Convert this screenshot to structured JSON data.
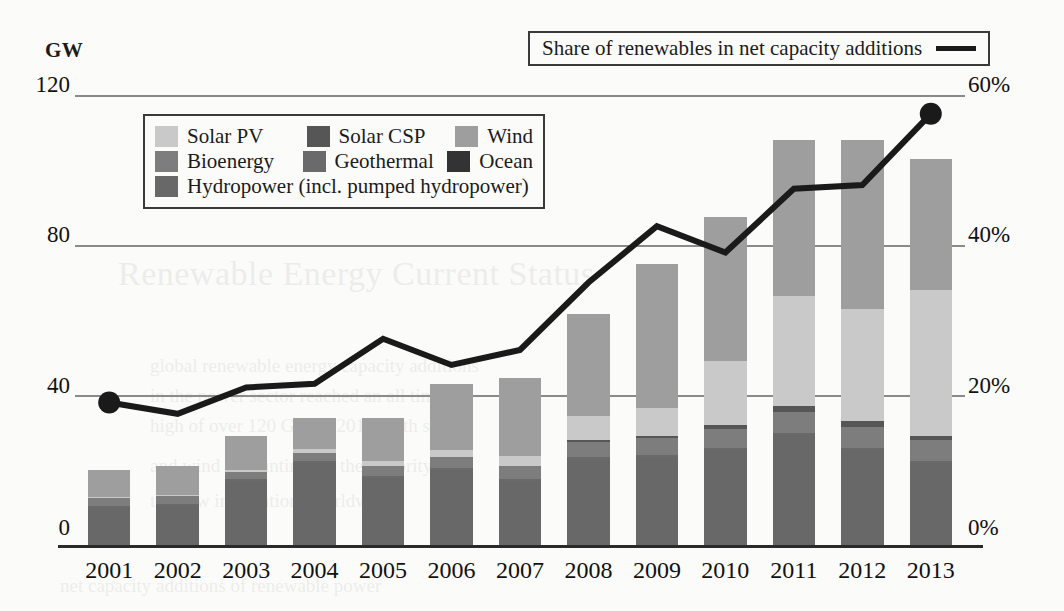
{
  "axis": {
    "unit_label": "GW",
    "left_ticks": [
      "120",
      "80",
      "40",
      "0"
    ],
    "right_ticks": [
      "60%",
      "40%",
      "20%",
      "0%"
    ],
    "x_labels": [
      "2001",
      "2002",
      "2003",
      "2004",
      "2005",
      "2006",
      "2007",
      "2008",
      "2009",
      "2010",
      "2011",
      "2012",
      "2013"
    ]
  },
  "line_legend": {
    "label": "Share of renewables in net capacity additions",
    "swatch": "line-swatch"
  },
  "legend": {
    "rows": [
      [
        {
          "label": "Solar PV",
          "color": "#c9c9c9"
        },
        {
          "label": "Solar CSP",
          "color": "#565656"
        },
        {
          "label": "Wind",
          "color": "#9e9e9e"
        }
      ],
      [
        {
          "label": "Bioenergy",
          "color": "#7d7d7d"
        },
        {
          "label": "Geothermal",
          "color": "#6a6a6a"
        },
        {
          "label": "Ocean",
          "color": "#333333"
        }
      ],
      [
        {
          "label": "Hydropower (incl. pumped hydropower)",
          "color": "#686868"
        }
      ]
    ]
  },
  "ghost_text": {
    "l1": "Renewable Energy Current Status",
    "l2": "global renewable energy capacity additions",
    "l3": "in the power sector reached an all time",
    "l4": "high of over 120 GW in 2013, with solar",
    "l5": "and wind accounting for the majority of",
    "l6": "the new installations worldwide",
    "l7": "net capacity additions of renewable power"
  },
  "chart_data": {
    "type": "bar",
    "title": "",
    "subtitle": "",
    "xlabel": "",
    "ylabel": "GW",
    "y2label": "%",
    "ylim": [
      0,
      120
    ],
    "y2lim": [
      0,
      60
    ],
    "grid": true,
    "legend_position": "inside-top-left",
    "categories": [
      "2001",
      "2002",
      "2003",
      "2004",
      "2005",
      "2006",
      "2007",
      "2008",
      "2009",
      "2010",
      "2011",
      "2012",
      "2013"
    ],
    "stack_order": [
      "Hydropower",
      "Ocean",
      "Geothermal",
      "Bioenergy",
      "Solar CSP",
      "Solar PV",
      "Wind"
    ],
    "colors": {
      "Hydropower": "#686868",
      "Ocean": "#333333",
      "Geothermal": "#6a6a6a",
      "Bioenergy": "#7d7d7d",
      "Solar CSP": "#565656",
      "Solar PV": "#c9c9c9",
      "Wind": "#9e9e9e"
    },
    "series": [
      {
        "name": "Hydropower",
        "values": [
          10.0,
          10.5,
          17.0,
          22.0,
          18.0,
          20.0,
          17.0,
          23.0,
          23.5,
          25.5,
          29.5,
          25.5,
          22.0
        ]
      },
      {
        "name": "Ocean",
        "values": [
          0.0,
          0.0,
          0.0,
          0.0,
          0.0,
          0.0,
          0.0,
          0.0,
          0.0,
          0.0,
          0.0,
          0.0,
          0.0
        ]
      },
      {
        "name": "Geothermal",
        "values": [
          0.5,
          0.5,
          0.5,
          0.5,
          0.5,
          0.5,
          0.5,
          0.5,
          0.5,
          0.5,
          0.5,
          0.5,
          0.5
        ]
      },
      {
        "name": "Bioenergy",
        "values": [
          2.0,
          2.0,
          2.0,
          2.0,
          2.5,
          3.0,
          3.5,
          4.0,
          4.5,
          5.0,
          5.5,
          5.5,
          5.5
        ]
      },
      {
        "name": "Solar CSP",
        "values": [
          0.0,
          0.0,
          0.0,
          0.0,
          0.0,
          0.0,
          0.0,
          0.5,
          0.5,
          1.0,
          1.5,
          1.5,
          1.0
        ]
      },
      {
        "name": "Solar PV",
        "values": [
          0.3,
          0.4,
          0.6,
          1.0,
          1.5,
          1.8,
          2.8,
          6.5,
          7.5,
          17.0,
          29.5,
          30.0,
          39.0
        ]
      },
      {
        "name": "Wind",
        "values": [
          7.2,
          7.6,
          8.9,
          8.5,
          11.5,
          17.7,
          20.7,
          27.0,
          38.5,
          38.5,
          41.5,
          45.0,
          35.0
        ]
      }
    ],
    "totals": [
      20.0,
      21.0,
      29.0,
      34.0,
      34.0,
      43.0,
      44.5,
      61.5,
      75.0,
      87.5,
      107.5,
      108.0,
      103.0
    ],
    "line_series": {
      "name": "Share of renewables in net capacity additions",
      "color": "#1a1a1a",
      "unit": "%",
      "marker_years": [
        "2001",
        "2013"
      ],
      "values": [
        19.0,
        17.5,
        21.0,
        21.5,
        27.5,
        24.0,
        26.0,
        35.0,
        42.5,
        39.0,
        47.5,
        48.0,
        57.5
      ]
    }
  }
}
